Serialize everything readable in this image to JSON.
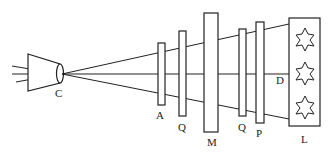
{
  "diagram": {
    "labels": {
      "C": "C",
      "A": "A",
      "Q1": "Q",
      "M": "M",
      "Q2": "Q",
      "P": "P",
      "D": "D",
      "L": "L"
    },
    "stroke_color": "#222222",
    "background": "#ffffff"
  }
}
